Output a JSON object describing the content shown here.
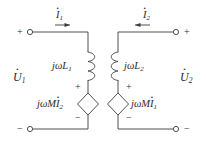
{
  "figure": {
    "stroke_color": "#3c3c3c",
    "text_color": "#2b2b2b",
    "background": "#ffffff"
  },
  "terminals": {
    "top_left_sign": "+",
    "bottom_left_sign": "−",
    "top_right_sign": "+",
    "bottom_right_sign": "−"
  },
  "currents": {
    "left": {
      "symbol": "I",
      "subscript": "1",
      "direction": "right"
    },
    "right": {
      "symbol": "I",
      "subscript": "2",
      "direction": "left"
    }
  },
  "voltages": {
    "left": {
      "symbol": "U",
      "subscript": "1"
    },
    "right": {
      "symbol": "U",
      "subscript": "2"
    }
  },
  "inductors": {
    "left": {
      "prefix": "jωL",
      "subscript": "1"
    },
    "right": {
      "prefix": "jωL",
      "subscript": "2"
    }
  },
  "sources": {
    "left": {
      "prefix": "jωM",
      "current_symbol": "I",
      "subscript": "2",
      "plus": "+",
      "minus": "−"
    },
    "right": {
      "prefix": "jωM",
      "current_symbol": "I",
      "subscript": "1",
      "plus": "+",
      "minus": "−"
    }
  }
}
